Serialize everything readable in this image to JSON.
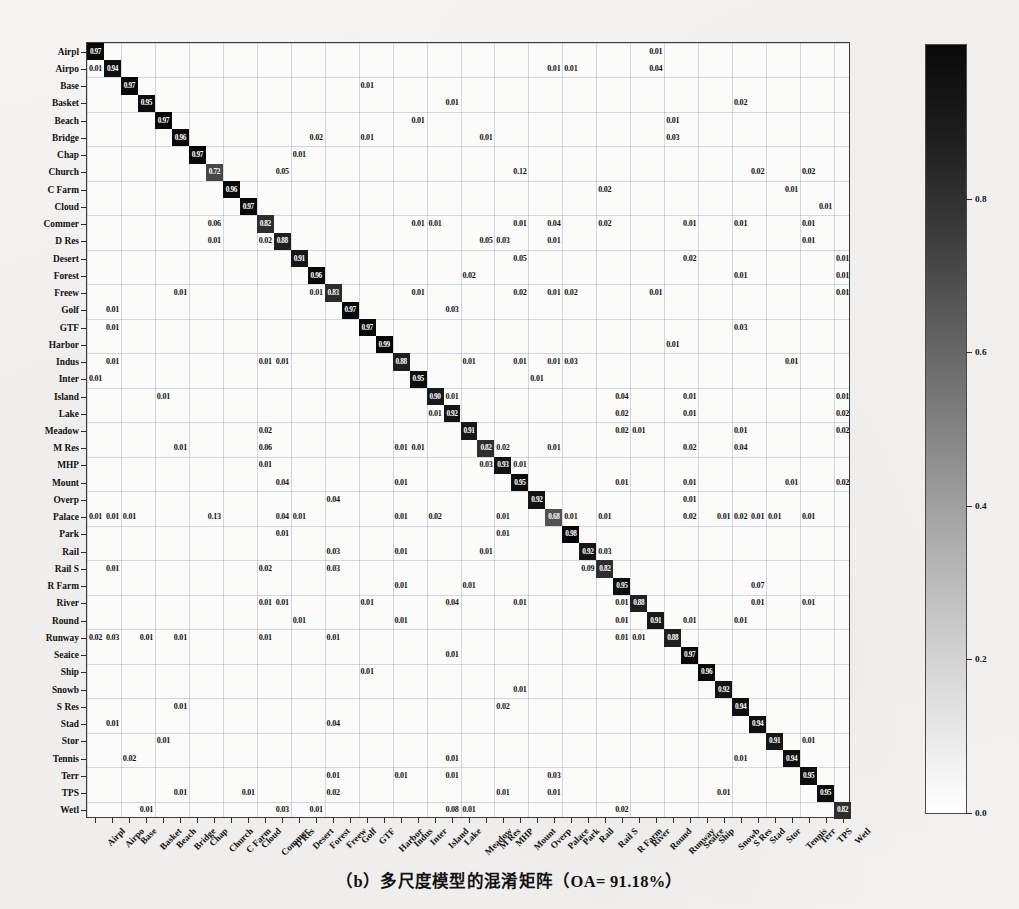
{
  "caption": "（b）多尺度模型的混淆矩阵（OA= 91.18%）",
  "chart_data": {
    "type": "heatmap",
    "title": "",
    "subtitle": "",
    "xlabel": "",
    "ylabel": "",
    "grid": true,
    "legend_position": "right",
    "colorbar": {
      "min": 0.0,
      "max": 1.0,
      "ticks": [
        "0.0",
        "0.2",
        "0.4",
        "0.6",
        "0.8"
      ],
      "tick_values": [
        0.0,
        0.2,
        0.4,
        0.6,
        0.8
      ],
      "colormap": "grayscale-white-to-black"
    },
    "overall_accuracy": "91.18%",
    "categories": [
      "Airpl",
      "Airpo",
      "Base",
      "Basket",
      "Beach",
      "Bridge",
      "Chap",
      "Church",
      "C Farm",
      "Cloud",
      "Commer",
      "D Res",
      "Desert",
      "Forest",
      "Freew",
      "Golf",
      "GTF",
      "Harbor",
      "Indus",
      "Inter",
      "Island",
      "Lake",
      "Meadow",
      "M Res",
      "MHP",
      "Mount",
      "Overp",
      "Palace",
      "Park",
      "Rail",
      "Rail S",
      "R Farm",
      "River",
      "Round",
      "Runway",
      "Seaice",
      "Ship",
      "Snowb",
      "S Res",
      "Stad",
      "Stor",
      "Tennis",
      "Terr",
      "TPS",
      "Wetl"
    ],
    "x_categories": [
      "Airpl",
      "Airpo",
      "Base",
      "Basket",
      "Beach",
      "Bridge",
      "Chap",
      "Church",
      "C Farm",
      "Cloud",
      "Commer",
      "D Res",
      "Desert",
      "Forest",
      "Freew",
      "Golf",
      "GTF",
      "Harbor",
      "Indus",
      "Inter",
      "Island",
      "Lake",
      "Meadow",
      "M Res",
      "MHP",
      "Mount",
      "Overp",
      "Palace",
      "Park",
      "Rail",
      "Rail S",
      "R Farm",
      "River",
      "Round",
      "Runway",
      "Seaice",
      "Ship",
      "Snowb",
      "S Res",
      "Stad",
      "Stor",
      "Tennis",
      "Terr",
      "TPS",
      "Wetl"
    ],
    "diagonal": [
      0.97,
      0.94,
      0.97,
      0.95,
      0.97,
      0.96,
      0.97,
      0.72,
      0.96,
      0.97,
      0.82,
      0.88,
      0.91,
      0.96,
      0.83,
      0.97,
      0.97,
      0.99,
      0.88,
      0.95,
      0.9,
      0.92,
      0.91,
      0.82,
      0.93,
      0.95,
      0.92,
      0.68,
      0.98,
      0.92,
      0.82,
      0.95,
      0.88,
      0.91,
      0.88,
      0.97,
      0.96,
      0.92,
      0.94,
      0.94,
      0.91,
      0.94,
      0.95,
      0.95,
      0.82
    ],
    "cells": [
      {
        "r": 0,
        "c": 0,
        "v": "0.97"
      },
      {
        "r": 0,
        "c": 33,
        "v": "0.01"
      },
      {
        "r": 1,
        "c": 0,
        "v": "0.01"
      },
      {
        "r": 1,
        "c": 1,
        "v": "0.94"
      },
      {
        "r": 1,
        "c": 27,
        "v": "0.01"
      },
      {
        "r": 1,
        "c": 28,
        "v": "0.01"
      },
      {
        "r": 1,
        "c": 33,
        "v": "0.04"
      },
      {
        "r": 2,
        "c": 2,
        "v": "0.97"
      },
      {
        "r": 2,
        "c": 16,
        "v": "0.01"
      },
      {
        "r": 3,
        "c": 3,
        "v": "0.95"
      },
      {
        "r": 3,
        "c": 21,
        "v": "0.01"
      },
      {
        "r": 3,
        "c": 38,
        "v": "0.02"
      },
      {
        "r": 4,
        "c": 4,
        "v": "0.97"
      },
      {
        "r": 4,
        "c": 19,
        "v": "0.01"
      },
      {
        "r": 4,
        "c": 34,
        "v": "0.01"
      },
      {
        "r": 5,
        "c": 5,
        "v": "0.96"
      },
      {
        "r": 5,
        "c": 13,
        "v": "0.02"
      },
      {
        "r": 5,
        "c": 16,
        "v": "0.01"
      },
      {
        "r": 5,
        "c": 23,
        "v": "0.01"
      },
      {
        "r": 5,
        "c": 34,
        "v": "0.03"
      },
      {
        "r": 6,
        "c": 6,
        "v": "0.97"
      },
      {
        "r": 6,
        "c": 12,
        "v": "0.01"
      },
      {
        "r": 7,
        "c": 7,
        "v": "0.72"
      },
      {
        "r": 7,
        "c": 11,
        "v": "0.05"
      },
      {
        "r": 7,
        "c": 25,
        "v": "0.12"
      },
      {
        "r": 7,
        "c": 39,
        "v": "0.02"
      },
      {
        "r": 7,
        "c": 42,
        "v": "0.02"
      },
      {
        "r": 8,
        "c": 8,
        "v": "0.96"
      },
      {
        "r": 8,
        "c": 30,
        "v": "0.02"
      },
      {
        "r": 8,
        "c": 41,
        "v": "0.01"
      },
      {
        "r": 9,
        "c": 9,
        "v": "0.97"
      },
      {
        "r": 9,
        "c": 43,
        "v": "0.01"
      },
      {
        "r": 10,
        "c": 7,
        "v": "0.06"
      },
      {
        "r": 10,
        "c": 10,
        "v": "0.82"
      },
      {
        "r": 10,
        "c": 19,
        "v": "0.01"
      },
      {
        "r": 10,
        "c": 20,
        "v": "0.01"
      },
      {
        "r": 10,
        "c": 25,
        "v": "0.01"
      },
      {
        "r": 10,
        "c": 27,
        "v": "0.04"
      },
      {
        "r": 10,
        "c": 30,
        "v": "0.02"
      },
      {
        "r": 10,
        "c": 35,
        "v": "0.01"
      },
      {
        "r": 10,
        "c": 38,
        "v": "0.01"
      },
      {
        "r": 10,
        "c": 42,
        "v": "0.01"
      },
      {
        "r": 11,
        "c": 7,
        "v": "0.01"
      },
      {
        "r": 11,
        "c": 10,
        "v": "0.02"
      },
      {
        "r": 11,
        "c": 11,
        "v": "0.88"
      },
      {
        "r": 11,
        "c": 23,
        "v": "0.05"
      },
      {
        "r": 11,
        "c": 24,
        "v": "0.03"
      },
      {
        "r": 11,
        "c": 27,
        "v": "0.01"
      },
      {
        "r": 11,
        "c": 42,
        "v": "0.01"
      },
      {
        "r": 12,
        "c": 12,
        "v": "0.91"
      },
      {
        "r": 12,
        "c": 25,
        "v": "0.05"
      },
      {
        "r": 12,
        "c": 35,
        "v": "0.02"
      },
      {
        "r": 12,
        "c": 44,
        "v": "0.01"
      },
      {
        "r": 13,
        "c": 13,
        "v": "0.96"
      },
      {
        "r": 13,
        "c": 22,
        "v": "0.02"
      },
      {
        "r": 13,
        "c": 38,
        "v": "0.01"
      },
      {
        "r": 13,
        "c": 44,
        "v": "0.01"
      },
      {
        "r": 14,
        "c": 5,
        "v": "0.01"
      },
      {
        "r": 14,
        "c": 13,
        "v": "0.01"
      },
      {
        "r": 14,
        "c": 14,
        "v": "0.83"
      },
      {
        "r": 14,
        "c": 19,
        "v": "0.01"
      },
      {
        "r": 14,
        "c": 25,
        "v": "0.02"
      },
      {
        "r": 14,
        "c": 27,
        "v": "0.01"
      },
      {
        "r": 14,
        "c": 28,
        "v": "0.02"
      },
      {
        "r": 14,
        "c": 33,
        "v": "0.01"
      },
      {
        "r": 14,
        "c": 44,
        "v": "0.01"
      },
      {
        "r": 15,
        "c": 1,
        "v": "0.01"
      },
      {
        "r": 15,
        "c": 15,
        "v": "0.97"
      },
      {
        "r": 15,
        "c": 21,
        "v": "0.03"
      },
      {
        "r": 16,
        "c": 1,
        "v": "0.01"
      },
      {
        "r": 16,
        "c": 16,
        "v": "0.97"
      },
      {
        "r": 16,
        "c": 38,
        "v": "0.03"
      },
      {
        "r": 17,
        "c": 17,
        "v": "0.99"
      },
      {
        "r": 17,
        "c": 34,
        "v": "0.01"
      },
      {
        "r": 18,
        "c": 1,
        "v": "0.01"
      },
      {
        "r": 18,
        "c": 10,
        "v": "0.01"
      },
      {
        "r": 18,
        "c": 11,
        "v": "0.01"
      },
      {
        "r": 18,
        "c": 18,
        "v": "0.88"
      },
      {
        "r": 18,
        "c": 22,
        "v": "0.01"
      },
      {
        "r": 18,
        "c": 25,
        "v": "0.01"
      },
      {
        "r": 18,
        "c": 27,
        "v": "0.01"
      },
      {
        "r": 18,
        "c": 28,
        "v": "0.03"
      },
      {
        "r": 18,
        "c": 41,
        "v": "0.01"
      },
      {
        "r": 19,
        "c": 0,
        "v": "0.01"
      },
      {
        "r": 19,
        "c": 19,
        "v": "0.95"
      },
      {
        "r": 19,
        "c": 26,
        "v": "0.01"
      },
      {
        "r": 20,
        "c": 4,
        "v": "0.01"
      },
      {
        "r": 20,
        "c": 20,
        "v": "0.90"
      },
      {
        "r": 20,
        "c": 21,
        "v": "0.01"
      },
      {
        "r": 20,
        "c": 31,
        "v": "0.04"
      },
      {
        "r": 20,
        "c": 35,
        "v": "0.01"
      },
      {
        "r": 20,
        "c": 44,
        "v": "0.01"
      },
      {
        "r": 21,
        "c": 20,
        "v": "0.01"
      },
      {
        "r": 21,
        "c": 21,
        "v": "0.92"
      },
      {
        "r": 21,
        "c": 31,
        "v": "0.02"
      },
      {
        "r": 21,
        "c": 35,
        "v": "0.01"
      },
      {
        "r": 21,
        "c": 44,
        "v": "0.02"
      },
      {
        "r": 22,
        "c": 10,
        "v": "0.02"
      },
      {
        "r": 22,
        "c": 22,
        "v": "0.91"
      },
      {
        "r": 22,
        "c": 31,
        "v": "0.02"
      },
      {
        "r": 22,
        "c": 32,
        "v": "0.01"
      },
      {
        "r": 22,
        "c": 38,
        "v": "0.01"
      },
      {
        "r": 22,
        "c": 44,
        "v": "0.02"
      },
      {
        "r": 23,
        "c": 5,
        "v": "0.01"
      },
      {
        "r": 23,
        "c": 10,
        "v": "0.06"
      },
      {
        "r": 23,
        "c": 18,
        "v": "0.01"
      },
      {
        "r": 23,
        "c": 19,
        "v": "0.01"
      },
      {
        "r": 23,
        "c": 23,
        "v": "0.82"
      },
      {
        "r": 23,
        "c": 24,
        "v": "0.02"
      },
      {
        "r": 23,
        "c": 27,
        "v": "0.01"
      },
      {
        "r": 23,
        "c": 35,
        "v": "0.02"
      },
      {
        "r": 23,
        "c": 38,
        "v": "0.04"
      },
      {
        "r": 24,
        "c": 10,
        "v": "0.01"
      },
      {
        "r": 24,
        "c": 23,
        "v": "0.03"
      },
      {
        "r": 24,
        "c": 24,
        "v": "0.93"
      },
      {
        "r": 24,
        "c": 25,
        "v": "0.01"
      },
      {
        "r": 25,
        "c": 11,
        "v": "0.04"
      },
      {
        "r": 25,
        "c": 18,
        "v": "0.01"
      },
      {
        "r": 25,
        "c": 25,
        "v": "0.95"
      },
      {
        "r": 25,
        "c": 31,
        "v": "0.01"
      },
      {
        "r": 25,
        "c": 35,
        "v": "0.01"
      },
      {
        "r": 25,
        "c": 41,
        "v": "0.01"
      },
      {
        "r": 25,
        "c": 44,
        "v": "0.02"
      },
      {
        "r": 26,
        "c": 14,
        "v": "0.04"
      },
      {
        "r": 26,
        "c": 26,
        "v": "0.92"
      },
      {
        "r": 26,
        "c": 35,
        "v": "0.01"
      },
      {
        "r": 27,
        "c": 0,
        "v": "0.01"
      },
      {
        "r": 27,
        "c": 1,
        "v": "0.01"
      },
      {
        "r": 27,
        "c": 2,
        "v": "0.01"
      },
      {
        "r": 27,
        "c": 7,
        "v": "0.13"
      },
      {
        "r": 27,
        "c": 11,
        "v": "0.04"
      },
      {
        "r": 27,
        "c": 12,
        "v": "0.01"
      },
      {
        "r": 27,
        "c": 18,
        "v": "0.01"
      },
      {
        "r": 27,
        "c": 20,
        "v": "0.02"
      },
      {
        "r": 27,
        "c": 24,
        "v": "0.01"
      },
      {
        "r": 27,
        "c": 27,
        "v": "0.68"
      },
      {
        "r": 27,
        "c": 28,
        "v": "0.01"
      },
      {
        "r": 27,
        "c": 30,
        "v": "0.01"
      },
      {
        "r": 27,
        "c": 35,
        "v": "0.02"
      },
      {
        "r": 27,
        "c": 37,
        "v": "0.01"
      },
      {
        "r": 27,
        "c": 38,
        "v": "0.02"
      },
      {
        "r": 27,
        "c": 39,
        "v": "0.01"
      },
      {
        "r": 27,
        "c": 40,
        "v": "0.01"
      },
      {
        "r": 27,
        "c": 42,
        "v": "0.01"
      },
      {
        "r": 28,
        "c": 11,
        "v": "0.01"
      },
      {
        "r": 28,
        "c": 28,
        "v": "0.98"
      },
      {
        "r": 28,
        "c": 24,
        "v": "0.01"
      },
      {
        "r": 29,
        "c": 14,
        "v": "0.03"
      },
      {
        "r": 29,
        "c": 18,
        "v": "0.01"
      },
      {
        "r": 29,
        "c": 29,
        "v": "0.92"
      },
      {
        "r": 29,
        "c": 30,
        "v": "0.03"
      },
      {
        "r": 29,
        "c": 23,
        "v": "0.01"
      },
      {
        "r": 30,
        "c": 1,
        "v": "0.01"
      },
      {
        "r": 30,
        "c": 10,
        "v": "0.02"
      },
      {
        "r": 30,
        "c": 14,
        "v": "0.03"
      },
      {
        "r": 30,
        "c": 29,
        "v": "0.09"
      },
      {
        "r": 30,
        "c": 30,
        "v": "0.82"
      },
      {
        "r": 31,
        "c": 18,
        "v": "0.01"
      },
      {
        "r": 31,
        "c": 22,
        "v": "0.01"
      },
      {
        "r": 31,
        "c": 31,
        "v": "0.95"
      },
      {
        "r": 31,
        "c": 39,
        "v": "0.07"
      },
      {
        "r": 32,
        "c": 10,
        "v": "0.01"
      },
      {
        "r": 32,
        "c": 11,
        "v": "0.01"
      },
      {
        "r": 32,
        "c": 16,
        "v": "0.01"
      },
      {
        "r": 32,
        "c": 21,
        "v": "0.04"
      },
      {
        "r": 32,
        "c": 25,
        "v": "0.01"
      },
      {
        "r": 32,
        "c": 31,
        "v": "0.01"
      },
      {
        "r": 32,
        "c": 32,
        "v": "0.88"
      },
      {
        "r": 32,
        "c": 39,
        "v": "0.01"
      },
      {
        "r": 32,
        "c": 42,
        "v": "0.01"
      },
      {
        "r": 33,
        "c": 12,
        "v": "0.01"
      },
      {
        "r": 33,
        "c": 18,
        "v": "0.01"
      },
      {
        "r": 33,
        "c": 31,
        "v": "0.01"
      },
      {
        "r": 33,
        "c": 33,
        "v": "0.91"
      },
      {
        "r": 33,
        "c": 35,
        "v": "0.01"
      },
      {
        "r": 33,
        "c": 38,
        "v": "0.01"
      },
      {
        "r": 34,
        "c": 0,
        "v": "0.02"
      },
      {
        "r": 34,
        "c": 1,
        "v": "0.03"
      },
      {
        "r": 34,
        "c": 3,
        "v": "0.01"
      },
      {
        "r": 34,
        "c": 5,
        "v": "0.01"
      },
      {
        "r": 34,
        "c": 10,
        "v": "0.01"
      },
      {
        "r": 34,
        "c": 14,
        "v": "0.01"
      },
      {
        "r": 34,
        "c": 31,
        "v": "0.01"
      },
      {
        "r": 34,
        "c": 32,
        "v": "0.01"
      },
      {
        "r": 34,
        "c": 34,
        "v": "0.88"
      },
      {
        "r": 35,
        "c": 21,
        "v": "0.01"
      },
      {
        "r": 35,
        "c": 35,
        "v": "0.97"
      },
      {
        "r": 36,
        "c": 16,
        "v": "0.01"
      },
      {
        "r": 36,
        "c": 36,
        "v": "0.96"
      },
      {
        "r": 37,
        "c": 25,
        "v": "0.01"
      },
      {
        "r": 37,
        "c": 37,
        "v": "0.92"
      },
      {
        "r": 38,
        "c": 5,
        "v": "0.01"
      },
      {
        "r": 38,
        "c": 24,
        "v": "0.02"
      },
      {
        "r": 38,
        "c": 38,
        "v": "0.94"
      },
      {
        "r": 39,
        "c": 1,
        "v": "0.01"
      },
      {
        "r": 39,
        "c": 14,
        "v": "0.04"
      },
      {
        "r": 39,
        "c": 39,
        "v": "0.94"
      },
      {
        "r": 40,
        "c": 4,
        "v": "0.01"
      },
      {
        "r": 40,
        "c": 40,
        "v": "0.91"
      },
      {
        "r": 40,
        "c": 42,
        "v": "0.01"
      },
      {
        "r": 41,
        "c": 2,
        "v": "0.02"
      },
      {
        "r": 41,
        "c": 21,
        "v": "0.01"
      },
      {
        "r": 41,
        "c": 38,
        "v": "0.01"
      },
      {
        "r": 41,
        "c": 41,
        "v": "0.94"
      },
      {
        "r": 42,
        "c": 14,
        "v": "0.01"
      },
      {
        "r": 42,
        "c": 18,
        "v": "0.01"
      },
      {
        "r": 42,
        "c": 21,
        "v": "0.01"
      },
      {
        "r": 42,
        "c": 27,
        "v": "0.03"
      },
      {
        "r": 42,
        "c": 42,
        "v": "0.95"
      },
      {
        "r": 43,
        "c": 5,
        "v": "0.01"
      },
      {
        "r": 43,
        "c": 9,
        "v": "0.01"
      },
      {
        "r": 43,
        "c": 14,
        "v": "0.02"
      },
      {
        "r": 43,
        "c": 24,
        "v": "0.01"
      },
      {
        "r": 43,
        "c": 27,
        "v": "0.01"
      },
      {
        "r": 43,
        "c": 37,
        "v": "0.01"
      },
      {
        "r": 43,
        "c": 43,
        "v": "0.95"
      },
      {
        "r": 44,
        "c": 3,
        "v": "0.01"
      },
      {
        "r": 44,
        "c": 11,
        "v": "0.03"
      },
      {
        "r": 44,
        "c": 13,
        "v": "0.01"
      },
      {
        "r": 44,
        "c": 21,
        "v": "0.08"
      },
      {
        "r": 44,
        "c": 22,
        "v": "0.01"
      },
      {
        "r": 44,
        "c": 31,
        "v": "0.02"
      },
      {
        "r": 44,
        "c": 44,
        "v": "0.82"
      }
    ]
  }
}
